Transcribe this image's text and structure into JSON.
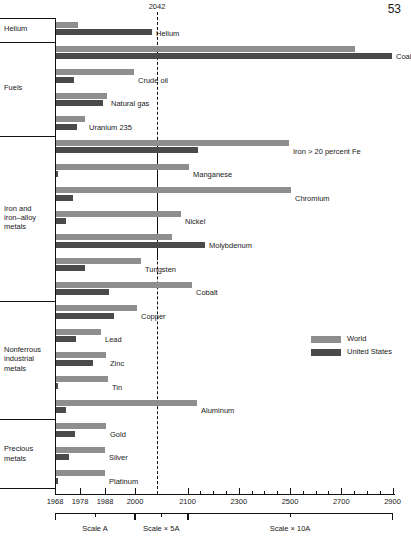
{
  "page_number": "53",
  "projection_year_label": "2042",
  "legend": [
    {
      "key": "world",
      "label": "World",
      "color": "#8e8e8e"
    },
    {
      "key": "us",
      "label": "United States",
      "color": "#4a4a4a"
    }
  ],
  "axis": {
    "tick_labels": [
      "1968",
      "1978",
      "1988",
      "2000",
      "2100",
      "2300",
      "2500",
      "2700",
      "2900"
    ],
    "minor_ticks": [
      2150,
      2200,
      2250,
      2350,
      2400,
      2450,
      2550,
      2600,
      2650,
      2750,
      2800,
      2850
    ],
    "scale_segments": [
      {
        "label": "Scale A",
        "from": 1968,
        "to": 2000
      },
      {
        "label": "Scale × 5A",
        "from": 2000,
        "to": 2100
      },
      {
        "label": "Scale × 10A",
        "from": 2100,
        "to": 2900
      }
    ]
  },
  "groups": [
    {
      "label": "Helium",
      "commodities": [
        "Helium"
      ]
    },
    {
      "label": "Fuels",
      "commodities": [
        "Coal",
        "Crude oil",
        "Natural gas",
        "Uranium 235"
      ]
    },
    {
      "label": "Iron and\niron–alloy\nmetals",
      "commodities": [
        "Iron > 20 percent Fe",
        "Manganese",
        "Chromium",
        "Nickel",
        "Molybdenum",
        "Tungsten",
        "Cobalt"
      ]
    },
    {
      "label": "Nonferrous\nindustrial\nmetals",
      "commodities": [
        "Copper",
        "Lead",
        "Zinc",
        "Tin",
        "Aluminum"
      ]
    },
    {
      "label": "Precious\nmetals",
      "commodities": [
        "Gold",
        "Silver",
        "Platinum"
      ]
    }
  ],
  "chart_data": {
    "type": "bar",
    "title": "",
    "xlabel": "Year of depletion (broken / compressed scale)",
    "ylabel": "",
    "orientation": "horizontal",
    "grid": false,
    "legend_position": "right",
    "axis_note": "Horizontal axis is a three-part broken scale: Scale A spans 1968–2000, Scale ×5A spans 2000–2100, Scale ×10A spans 2100–2900.",
    "xlim": [
      1968,
      2900
    ],
    "projection_line": 2042,
    "categories": [
      "Helium",
      "Coal",
      "Crude oil",
      "Natural gas",
      "Uranium 235",
      "Iron > 20 percent Fe",
      "Manganese",
      "Chromium",
      "Nickel",
      "Molybdenum",
      "Tungsten",
      "Cobalt",
      "Copper",
      "Lead",
      "Zinc",
      "Tin",
      "Aluminum",
      "Gold",
      "Silver",
      "Platinum"
    ],
    "series": [
      {
        "name": "World",
        "color": "#8e8e8e",
        "values": [
          1983,
          2780,
          2000,
          2000,
          1979,
          2460,
          2225,
          2475,
          2110,
          2000,
          2000,
          2145,
          2005,
          1996,
          2000,
          2000,
          2200,
          2000,
          2000,
          2000
        ]
      },
      {
        "name": "United States",
        "color": "#4a4a4a",
        "values": [
          2100,
          2900,
          1976,
          1995,
          1976,
          2145,
          1970,
          1975,
          1973,
          2320,
          1979,
          2015,
          2035,
          1977,
          1990,
          1970,
          1973,
          1977,
          1973,
          1969
        ]
      }
    ],
    "bars": [
      {
        "category": "Helium",
        "group": "Helium",
        "world_year": 1983,
        "us_year": 2100,
        "world_px": 78,
        "us_px": 152
      },
      {
        "category": "Coal",
        "group": "Fuels",
        "world_year": 2780,
        "us_year": 2900,
        "world_px": 355,
        "us_px": 392
      },
      {
        "category": "Crude oil",
        "group": "Fuels",
        "world_year": 2000,
        "us_year": 1976,
        "world_px": 134,
        "us_px": 74
      },
      {
        "category": "Natural gas",
        "group": "Fuels",
        "world_year": 2000,
        "us_year": 1995,
        "world_px": 107,
        "us_px": 103
      },
      {
        "category": "Uranium 235",
        "group": "Fuels",
        "world_year": 1979,
        "us_year": 1976,
        "world_px": 85,
        "us_px": 77
      },
      {
        "category": "Iron > 20 percent Fe",
        "group": "Iron",
        "world_year": 2460,
        "us_year": 2145,
        "world_px": 289,
        "us_px": 198
      },
      {
        "category": "Manganese",
        "group": "Iron",
        "world_year": 2225,
        "us_year": 1970,
        "world_px": 189,
        "us_px": 57
      },
      {
        "category": "Chromium",
        "group": "Iron",
        "world_year": 2475,
        "us_year": 1975,
        "world_px": 291,
        "us_px": 73
      },
      {
        "category": "Nickel",
        "group": "Iron",
        "world_year": 2110,
        "us_year": 1973,
        "world_px": 181,
        "us_px": 66
      },
      {
        "category": "Molybdenum",
        "group": "Iron",
        "world_year": 2000,
        "us_year": 2320,
        "world_px": 172,
        "us_px": 205
      },
      {
        "category": "Tungsten",
        "group": "Iron",
        "world_year": 2000,
        "us_year": 1979,
        "world_px": 141,
        "us_px": 85
      },
      {
        "category": "Cobalt",
        "group": "Iron",
        "world_year": 2145,
        "us_year": 2015,
        "world_px": 192,
        "us_px": 109
      },
      {
        "category": "Copper",
        "group": "Nonferrous",
        "world_year": 2005,
        "us_year": 2035,
        "world_px": 137,
        "us_px": 114
      },
      {
        "category": "Lead",
        "group": "Nonferrous",
        "world_year": 1996,
        "us_year": 1977,
        "world_px": 101,
        "us_px": 76
      },
      {
        "category": "Zinc",
        "group": "Nonferrous",
        "world_year": 2000,
        "us_year": 1990,
        "world_px": 106,
        "us_px": 93
      },
      {
        "category": "Tin",
        "group": "Nonferrous",
        "world_year": 2000,
        "us_year": 1970,
        "world_px": 108,
        "us_px": 57
      },
      {
        "category": "Aluminum",
        "group": "Nonferrous",
        "world_year": 2200,
        "us_year": 1973,
        "world_px": 197,
        "us_px": 66
      },
      {
        "category": "Gold",
        "group": "Precious",
        "world_year": 2000,
        "us_year": 1977,
        "world_px": 106,
        "us_px": 75
      },
      {
        "category": "Silver",
        "group": "Precious",
        "world_year": 2000,
        "us_year": 1973,
        "world_px": 105,
        "us_px": 69
      },
      {
        "category": "Platinum",
        "group": "Precious",
        "world_year": 2000,
        "us_year": 1969,
        "world_px": 105,
        "us_px": 56
      }
    ]
  }
}
